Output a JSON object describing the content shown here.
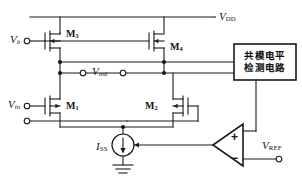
{
  "diagram": {
    "colors": {
      "wire": "#1a1a1a",
      "background": "#ffffff",
      "text": "#111111"
    },
    "supply_rail": {
      "label_v": "V",
      "label_sub": "DD"
    },
    "transistors": [
      {
        "id": "M3",
        "letter": "M",
        "index": "3"
      },
      {
        "id": "M4",
        "letter": "M",
        "index": "4"
      },
      {
        "id": "M1",
        "letter": "M",
        "index": "1"
      },
      {
        "id": "M2",
        "letter": "M",
        "index": "2"
      }
    ],
    "nodes": {
      "bias_input": {
        "letter": "V",
        "index": "b"
      },
      "signal_input": {
        "letter": "V",
        "index": "in"
      },
      "output": {
        "letter": "V",
        "index": "out"
      },
      "reference": {
        "letter": "V",
        "index": "REF"
      }
    },
    "current_source": {
      "letter": "I",
      "index": "SS"
    },
    "cm_block": {
      "line1": "共模电平",
      "line2": "检测电路"
    },
    "opamp": {
      "plus": "+",
      "minus": "−"
    }
  }
}
